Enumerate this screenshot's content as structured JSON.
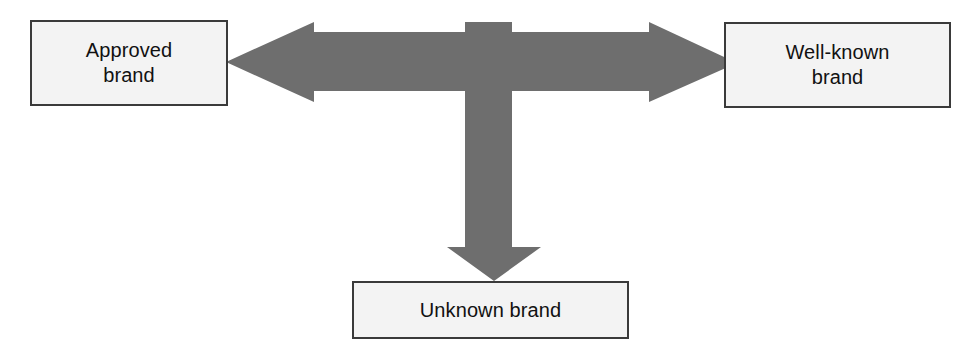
{
  "diagram": {
    "background_color": "#ffffff",
    "arrow_color": "#6e6e6e",
    "box_fill_color": "#f3f3f3",
    "box_border_color": "#3a3a3a",
    "text_color": "#111111",
    "nodes": [
      {
        "id": "approved-brand",
        "label": "Approved\nbrand",
        "position": "left"
      },
      {
        "id": "well-known-brand",
        "label": "Well-known\nbrand",
        "position": "right"
      },
      {
        "id": "unknown-brand",
        "label": "Unknown brand",
        "position": "bottom"
      }
    ],
    "connector": {
      "id": "tri-directional-arrow",
      "shape": "three-headed-t-arrow",
      "heads": [
        "left",
        "right",
        "down"
      ],
      "color": "#6e6e6e"
    }
  }
}
